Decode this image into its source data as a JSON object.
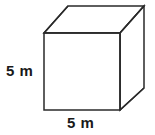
{
  "figure": {
    "name": "cube-diagram",
    "shape": "cube",
    "projection": "oblique",
    "background_color": "#ffffff",
    "stroke_color": "#2a2a2a",
    "fill_color": "#ffffff",
    "stroke_width": 1.5,
    "labels": {
      "height": "5 m",
      "width": "5 m"
    },
    "label_color": "#1a1a1a",
    "geometry": {
      "front_face": "44,33 120,33 120,110 44,110",
      "top_face": "44,33 68,6 144,6 120,33",
      "right_face": "120,33 144,6 144,88 120,110"
    }
  }
}
